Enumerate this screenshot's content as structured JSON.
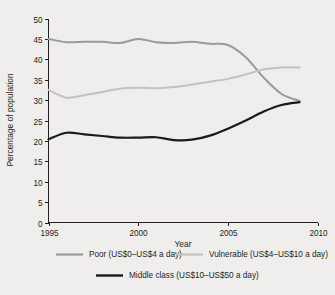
{
  "chart_data": {
    "type": "line",
    "title": "",
    "xlabel": "Year",
    "ylabel": "Percentage of population",
    "xlim": [
      1995,
      2010
    ],
    "ylim": [
      0,
      50
    ],
    "grid": false,
    "legend_position": "bottom",
    "x": [
      1995,
      1996,
      1997,
      1998,
      1999,
      2000,
      2001,
      2002,
      2003,
      2004,
      2005,
      2006,
      2007,
      2008,
      2009
    ],
    "xticks": [
      "1995",
      "2000",
      "2005",
      "2010"
    ],
    "xtick_values": [
      1995,
      2000,
      2005,
      2010
    ],
    "yticks": [
      "0",
      "5",
      "10",
      "15",
      "20",
      "25",
      "30",
      "35",
      "40",
      "45",
      "50"
    ],
    "ytick_values": [
      0,
      5,
      10,
      15,
      20,
      25,
      30,
      35,
      40,
      45,
      50
    ],
    "series": [
      {
        "name": "Poor (US$0–US$4 a day)",
        "color": "#9a9a9a",
        "width": 2.0,
        "values": [
          45.0,
          44.2,
          44.3,
          44.3,
          44.0,
          45.0,
          44.2,
          44.0,
          44.3,
          43.8,
          43.5,
          40.5,
          35.5,
          31.5,
          29.8
        ]
      },
      {
        "name": "Vulnerable (US$4–US$10 a day)",
        "color": "#c2c2c2",
        "width": 2.0,
        "values": [
          32.5,
          30.6,
          31.2,
          32.0,
          32.8,
          33.0,
          32.9,
          33.2,
          33.8,
          34.5,
          35.2,
          36.3,
          37.5,
          38.0,
          38.0
        ]
      },
      {
        "name": "Middle class (US$10–US$50 a day)",
        "color": "#1a1a1a",
        "width": 2.2,
        "values": [
          20.4,
          22.0,
          21.6,
          21.2,
          20.8,
          20.8,
          20.9,
          20.2,
          20.3,
          21.3,
          23.0,
          25.0,
          27.2,
          28.8,
          29.5
        ]
      }
    ],
    "legend": [
      {
        "label": "Poor (US$0–US$4 a day)",
        "color": "#9a9a9a"
      },
      {
        "label": "Vulnerable (US$4–US$10 a day)",
        "color": "#c2c2c2"
      },
      {
        "label": "Middle class (US$10–US$50 a day)",
        "color": "#1a1a1a"
      }
    ]
  }
}
